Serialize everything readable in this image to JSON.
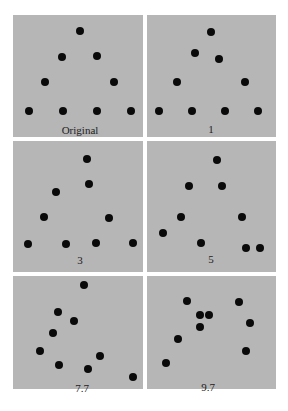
{
  "figure": {
    "colors": {
      "background": "#ffffff",
      "panel": "#b6b6b6",
      "dot": "#0a0a0a",
      "label": "#222222"
    },
    "panels": [
      {
        "label": "Original",
        "box": [
          13,
          15,
          130,
          122
        ],
        "label_pos": [
          80,
          125
        ],
        "dots": [
          [
            80,
            31
          ],
          [
            62,
            57
          ],
          [
            97,
            56
          ],
          [
            45,
            82
          ],
          [
            114,
            82
          ],
          [
            29,
            111
          ],
          [
            63,
            111
          ],
          [
            97,
            111
          ],
          [
            131,
            111
          ]
        ]
      },
      {
        "label": "1",
        "box": [
          147,
          15,
          129,
          122
        ],
        "label_pos": [
          211,
          124
        ],
        "dots": [
          [
            211,
            32
          ],
          [
            195,
            53
          ],
          [
            219,
            59
          ],
          [
            177,
            82
          ],
          [
            245,
            82
          ],
          [
            159,
            111
          ],
          [
            192,
            111
          ],
          [
            225,
            111
          ],
          [
            258,
            111
          ]
        ]
      },
      {
        "label": "3",
        "box": [
          13,
          141,
          130,
          131
        ],
        "label_pos": [
          80,
          255
        ],
        "dots": [
          [
            87,
            159
          ],
          [
            89,
            184
          ],
          [
            56,
            192
          ],
          [
            44,
            217
          ],
          [
            109,
            218
          ],
          [
            28,
            244
          ],
          [
            66,
            244
          ],
          [
            96,
            243
          ],
          [
            133,
            243
          ]
        ]
      },
      {
        "label": "5",
        "box": [
          147,
          141,
          129,
          131
        ],
        "label_pos": [
          211,
          254
        ],
        "dots": [
          [
            217,
            160
          ],
          [
            189,
            186
          ],
          [
            222,
            186
          ],
          [
            181,
            217
          ],
          [
            242,
            217
          ],
          [
            163,
            233
          ],
          [
            201,
            243
          ],
          [
            246,
            248
          ],
          [
            260,
            248
          ]
        ]
      },
      {
        "label": "7.7",
        "box": [
          13,
          276,
          130,
          113
        ],
        "label_pos": [
          82,
          383
        ],
        "dots": [
          [
            84,
            285
          ],
          [
            58,
            312
          ],
          [
            74,
            321
          ],
          [
            53,
            333
          ],
          [
            40,
            351
          ],
          [
            59,
            365
          ],
          [
            88,
            369
          ],
          [
            100,
            356
          ],
          [
            133,
            377
          ]
        ]
      },
      {
        "label": "9.7",
        "box": [
          147,
          276,
          129,
          113
        ],
        "label_pos": [
          208,
          382
        ],
        "dots": [
          [
            187,
            301
          ],
          [
            239,
            302
          ],
          [
            200,
            315
          ],
          [
            209,
            315
          ],
          [
            200,
            327
          ],
          [
            250,
            323
          ],
          [
            178,
            339
          ],
          [
            246,
            351
          ],
          [
            166,
            363
          ]
        ]
      }
    ]
  }
}
